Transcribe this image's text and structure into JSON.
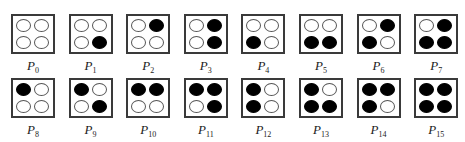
{
  "title": "",
  "patterns": [
    {
      "label": "P",
      "index": "0",
      "cells": [
        0,
        0,
        0,
        0
      ]
    },
    {
      "label": "P",
      "index": "1",
      "cells": [
        0,
        0,
        0,
        1
      ]
    },
    {
      "label": "P",
      "index": "2",
      "cells": [
        0,
        1,
        0,
        0
      ]
    },
    {
      "label": "P",
      "index": "3",
      "cells": [
        0,
        1,
        0,
        1
      ]
    },
    {
      "label": "P",
      "index": "4",
      "cells": [
        0,
        0,
        1,
        0
      ]
    },
    {
      "label": "P",
      "index": "5",
      "cells": [
        0,
        0,
        1,
        1
      ]
    },
    {
      "label": "P",
      "index": "6",
      "cells": [
        0,
        1,
        1,
        0
      ]
    },
    {
      "label": "P",
      "index": "7",
      "cells": [
        0,
        1,
        1,
        1
      ]
    },
    {
      "label": "P",
      "index": "8",
      "cells": [
        1,
        0,
        0,
        0
      ]
    },
    {
      "label": "P",
      "index": "9",
      "cells": [
        1,
        0,
        0,
        1
      ]
    },
    {
      "label": "P",
      "index": "10",
      "cells": [
        1,
        1,
        0,
        0
      ]
    },
    {
      "label": "P",
      "index": "11",
      "cells": [
        1,
        1,
        0,
        1
      ]
    },
    {
      "label": "P",
      "index": "12",
      "cells": [
        1,
        0,
        1,
        0
      ]
    },
    {
      "label": "P",
      "index": "13",
      "cells": [
        1,
        0,
        1,
        1
      ]
    },
    {
      "label": "P",
      "index": "14",
      "cells": [
        1,
        1,
        1,
        0
      ]
    },
    {
      "label": "P",
      "index": "15",
      "cells": [
        1,
        1,
        1,
        1
      ]
    }
  ],
  "legend": {
    "filled": "black circle",
    "empty": "white circle"
  }
}
